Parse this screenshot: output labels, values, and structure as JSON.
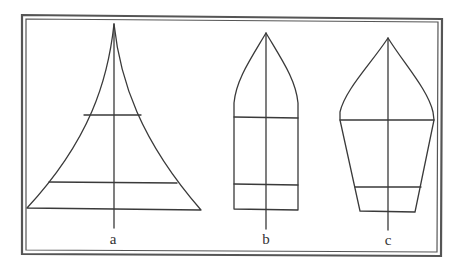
{
  "figure": {
    "type": "diagram",
    "stroke_color": "#3a3a3a",
    "frame_color": "#555555",
    "shapes": [
      {
        "id": "a",
        "label": "a",
        "form": "concave-sided triangle (flared spire)"
      },
      {
        "id": "b",
        "label": "b",
        "form": "rectangle with pointed gothic-arch top"
      },
      {
        "id": "c",
        "label": "c",
        "form": "inverted trapezoid with pointed arch top"
      }
    ]
  }
}
